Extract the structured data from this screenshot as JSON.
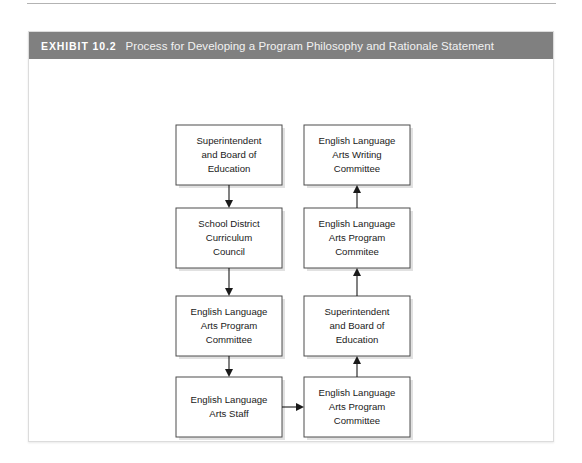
{
  "exhibit": {
    "label": "EXHIBIT 10.2",
    "title": "Process for Developing a Program Philosophy and Rationale Statement"
  },
  "colors": {
    "header_bar": "#808080",
    "header_text": "#ffffff",
    "panel_border": "#dcdcdc",
    "box_border": "#4d4d4d",
    "box_fill": "#ffffff",
    "connector": "#1a1a1a",
    "page_background": "#ffffff"
  },
  "diagram": {
    "type": "flowchart",
    "columns": [
      {
        "name": "left-column",
        "flow_direction": "top-to-bottom",
        "nodes": [
          {
            "id": "l1",
            "lines": [
              "Superintendent",
              "and Board of",
              "Education"
            ]
          },
          {
            "id": "l2",
            "lines": [
              "School District",
              "Curriculum",
              "Council"
            ]
          },
          {
            "id": "l3",
            "lines": [
              "English Language",
              "Arts Program",
              "Committee"
            ]
          },
          {
            "id": "l4",
            "lines": [
              "English Language",
              "Arts Staff"
            ]
          }
        ]
      },
      {
        "name": "right-column",
        "flow_direction": "bottom-to-top",
        "nodes": [
          {
            "id": "r1",
            "lines": [
              "English Language",
              "Arts Writing",
              "Committee"
            ]
          },
          {
            "id": "r2",
            "lines": [
              "English Language",
              "Arts Program",
              "Commitee"
            ]
          },
          {
            "id": "r3",
            "lines": [
              "Superintendent",
              "and Board of",
              "Education"
            ]
          },
          {
            "id": "r4",
            "lines": [
              "English Language",
              "Arts Program",
              "Committee"
            ]
          }
        ]
      }
    ],
    "connectors": [
      {
        "id": "c-l1-l2",
        "from": "l1",
        "to": "l2",
        "direction": "down"
      },
      {
        "id": "c-l2-l3",
        "from": "l2",
        "to": "l3",
        "direction": "down"
      },
      {
        "id": "c-l3-l4",
        "from": "l3",
        "to": "l4",
        "direction": "down"
      },
      {
        "id": "c-l4-r4",
        "from": "l4",
        "to": "r4",
        "direction": "right"
      },
      {
        "id": "c-r4-r3",
        "from": "r4",
        "to": "r3",
        "direction": "up"
      },
      {
        "id": "c-r3-r2",
        "from": "r3",
        "to": "r2",
        "direction": "up"
      },
      {
        "id": "c-r2-r1",
        "from": "r2",
        "to": "r1",
        "direction": "up"
      }
    ]
  }
}
